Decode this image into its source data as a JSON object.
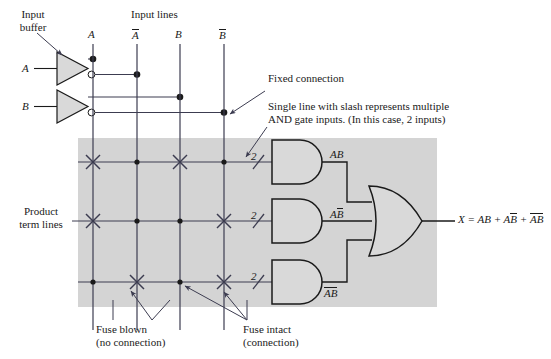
{
  "diagram": {
    "title_hidden": "PAL fuse matrix implementing X = AB + AB-bar + A-bar B-bar",
    "background_color": "#ffffff",
    "array_fill": "#d4d4d4",
    "line_color": "#3c3c50",
    "gate_fill": "#d9d9d9"
  },
  "labels": {
    "input_buffer_l1": "Input",
    "input_buffer_l2": "buffer",
    "input_lines": "Input lines",
    "product_term_l1": "Product",
    "product_term_l2": "term lines",
    "fixed_connection": "Fixed connection",
    "multi_input_l1": "Single line with slash represents multiple",
    "multi_input_l2": "AND gate inputs. (In this case, 2 inputs)",
    "fuse_blown_l1": "Fuse blown",
    "fuse_blown_l2": "(no connection)",
    "fuse_intact_l1": "Fuse intact",
    "fuse_intact_l2": "(connection)"
  },
  "buffer_inputs": [
    {
      "name": "A"
    },
    {
      "name": "B"
    }
  ],
  "input_lines": [
    {
      "id": "A",
      "base": "A",
      "bar": false,
      "x": 93
    },
    {
      "id": "An",
      "base": "A",
      "bar": true,
      "x": 137
    },
    {
      "id": "B",
      "base": "B",
      "bar": false,
      "x": 180
    },
    {
      "id": "Bn",
      "base": "B",
      "bar": true,
      "x": 224
    }
  ],
  "product_terms": [
    {
      "row": 1,
      "y": 162,
      "slash_count": "2",
      "out_base": "AB",
      "out_bar_first": false,
      "out_bar_second": false,
      "fuses": [
        {
          "col": "A",
          "state": "blown"
        },
        {
          "col": "An",
          "state": "intact"
        },
        {
          "col": "B",
          "state": "blown"
        },
        {
          "col": "Bn",
          "state": "intact"
        }
      ]
    },
    {
      "row": 2,
      "y": 221,
      "slash_count": "2",
      "out_base": "AB",
      "out_bar_first": false,
      "out_bar_second": true,
      "fuses": [
        {
          "col": "A",
          "state": "blown"
        },
        {
          "col": "An",
          "state": "intact"
        },
        {
          "col": "B",
          "state": "intact"
        },
        {
          "col": "Bn",
          "state": "blown"
        }
      ]
    },
    {
      "row": 3,
      "y": 282,
      "slash_count": "2",
      "out_base": "AB",
      "out_bar_first": true,
      "out_bar_second": true,
      "fuses": [
        {
          "col": "A",
          "state": "intact"
        },
        {
          "col": "An",
          "state": "blown"
        },
        {
          "col": "B",
          "state": "intact"
        },
        {
          "col": "Bn",
          "state": "blown"
        }
      ]
    }
  ],
  "output": {
    "equation_prefix": "X = AB + A",
    "equation_full": "X = AB + AB̄ + ĀB̄"
  }
}
